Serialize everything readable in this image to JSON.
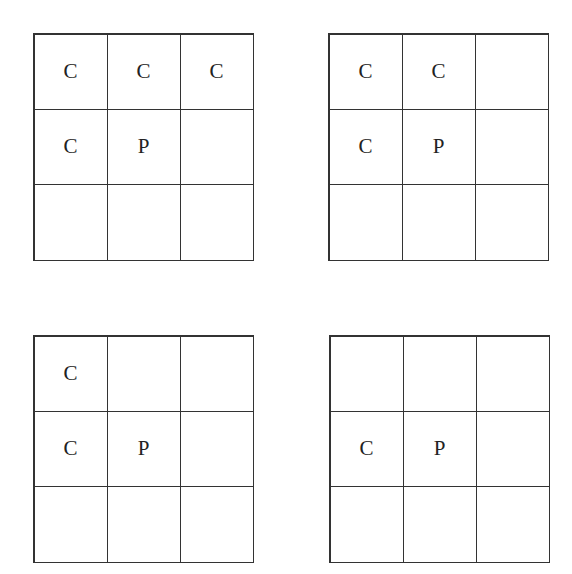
{
  "diagram": {
    "grids": [
      {
        "id": "top-left",
        "cells": [
          "C",
          "C",
          "C",
          "C",
          "P",
          "",
          "",
          "",
          ""
        ]
      },
      {
        "id": "top-right",
        "cells": [
          "C",
          "C",
          "",
          "C",
          "P",
          "",
          "",
          "",
          ""
        ]
      },
      {
        "id": "bottom-left",
        "cells": [
          "C",
          "",
          "",
          "C",
          "P",
          "",
          "",
          "",
          ""
        ]
      },
      {
        "id": "bottom-right",
        "cells": [
          "",
          "",
          "",
          "C",
          "P",
          "",
          "",
          "",
          ""
        ]
      }
    ]
  }
}
